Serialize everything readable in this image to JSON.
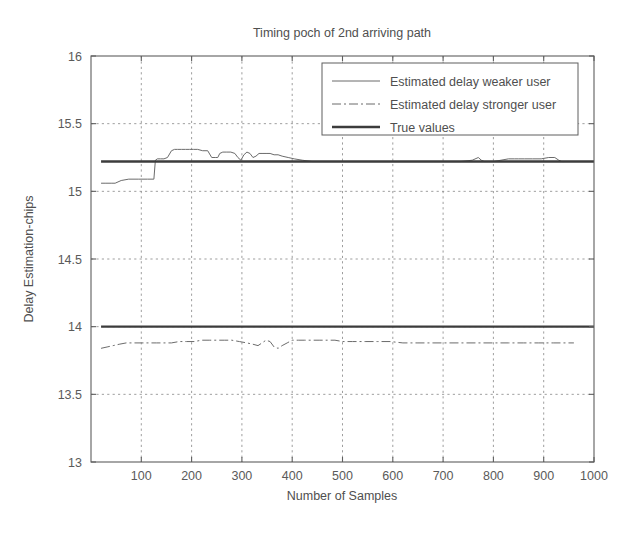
{
  "chart_data": {
    "type": "line",
    "title": "Timing poch of 2nd arriving path",
    "xlabel": "Number of Samples",
    "ylabel": "Delay Estimation-chips",
    "xlim": [
      0,
      1000
    ],
    "ylim": [
      13,
      16
    ],
    "xticks": [
      100,
      200,
      300,
      400,
      500,
      600,
      700,
      800,
      900,
      1000
    ],
    "yticks": [
      13,
      13.5,
      14,
      14.5,
      15,
      15.5,
      16
    ],
    "xtick_labels": [
      "100",
      "200",
      "300",
      "400",
      "500",
      "600",
      "700",
      "800",
      "900",
      "1000"
    ],
    "ytick_labels": [
      "13",
      "13.5",
      "14",
      "14.5",
      "15",
      "15.5",
      "16"
    ],
    "grid": true,
    "grid_style": "dotted",
    "legend_position": "top-right",
    "legend": [
      {
        "label": "Estimated delay weaker user",
        "style": "solid-thin"
      },
      {
        "label": "Estimated delay stronger user",
        "style": "dash-dot"
      },
      {
        "label": "True values",
        "style": "solid-thick"
      }
    ],
    "series": [
      {
        "name": "Estimated delay weaker user",
        "style": "solid-thin",
        "color": "#6b6b6b",
        "x": [
          20,
          28,
          40,
          48,
          60,
          75,
          95,
          112,
          125,
          128,
          132,
          138,
          145,
          152,
          160,
          166,
          172,
          180,
          188,
          196,
          204,
          212,
          222,
          232,
          240,
          248,
          252,
          256,
          262,
          270,
          278,
          286,
          292,
          298,
          304,
          310,
          316,
          322,
          328,
          334,
          340,
          348,
          356,
          364,
          372,
          380,
          392,
          404,
          420,
          440,
          460,
          480,
          500,
          520,
          545,
          570,
          595,
          620,
          650,
          680,
          710,
          735,
          758,
          770,
          776,
          782,
          790,
          800,
          815,
          830,
          842,
          850,
          862,
          878,
          895,
          910,
          922,
          930,
          936,
          942
        ],
        "y": [
          15.06,
          15.06,
          15.06,
          15.06,
          15.08,
          15.09,
          15.09,
          15.09,
          15.09,
          15.23,
          15.24,
          15.24,
          15.24,
          15.25,
          15.3,
          15.31,
          15.31,
          15.31,
          15.31,
          15.31,
          15.31,
          15.31,
          15.3,
          15.3,
          15.25,
          15.25,
          15.25,
          15.28,
          15.29,
          15.29,
          15.29,
          15.28,
          15.25,
          15.23,
          15.27,
          15.29,
          15.28,
          15.25,
          15.26,
          15.28,
          15.28,
          15.28,
          15.28,
          15.27,
          15.27,
          15.26,
          15.25,
          15.24,
          15.23,
          15.22,
          15.22,
          15.22,
          15.22,
          15.22,
          15.22,
          15.22,
          15.22,
          15.22,
          15.22,
          15.22,
          15.22,
          15.22,
          15.23,
          15.25,
          15.23,
          15.22,
          15.22,
          15.22,
          15.23,
          15.24,
          15.24,
          15.24,
          15.24,
          15.24,
          15.24,
          15.25,
          15.25,
          15.23,
          15.22,
          15.22
        ]
      },
      {
        "name": "Estimated delay stronger user",
        "style": "dash-dot",
        "color": "#6b6b6b",
        "x": [
          20,
          32,
          44,
          56,
          70,
          85,
          100,
          115,
          130,
          145,
          160,
          175,
          190,
          205,
          220,
          235,
          250,
          265,
          280,
          295,
          310,
          322,
          332,
          340,
          348,
          356,
          364,
          372,
          380,
          390,
          400,
          412,
          425,
          440,
          455,
          470,
          485,
          500,
          520,
          545,
          570,
          595,
          620,
          650,
          680,
          710,
          740,
          770,
          800,
          830,
          860,
          890,
          920,
          945,
          960
        ],
        "y": [
          13.84,
          13.85,
          13.86,
          13.87,
          13.88,
          13.88,
          13.88,
          13.88,
          13.88,
          13.88,
          13.88,
          13.89,
          13.89,
          13.89,
          13.9,
          13.9,
          13.9,
          13.9,
          13.9,
          13.89,
          13.88,
          13.87,
          13.86,
          13.88,
          13.9,
          13.89,
          13.85,
          13.84,
          13.86,
          13.88,
          13.9,
          13.9,
          13.9,
          13.9,
          13.9,
          13.9,
          13.9,
          13.89,
          13.89,
          13.89,
          13.89,
          13.89,
          13.88,
          13.88,
          13.88,
          13.88,
          13.88,
          13.88,
          13.88,
          13.88,
          13.88,
          13.88,
          13.88,
          13.88,
          13.88
        ]
      },
      {
        "name": "True values (upper)",
        "style": "solid-thick",
        "color": "#3c3c3c",
        "x": [
          20,
          1000
        ],
        "y": [
          15.22,
          15.22
        ]
      },
      {
        "name": "True values (lower)",
        "style": "solid-thick",
        "color": "#3c3c3c",
        "x": [
          20,
          1000
        ],
        "y": [
          14.0,
          14.0
        ]
      }
    ]
  },
  "figure": {
    "background_color": "#ffffff",
    "axis_color": "#5e5e5e"
  }
}
